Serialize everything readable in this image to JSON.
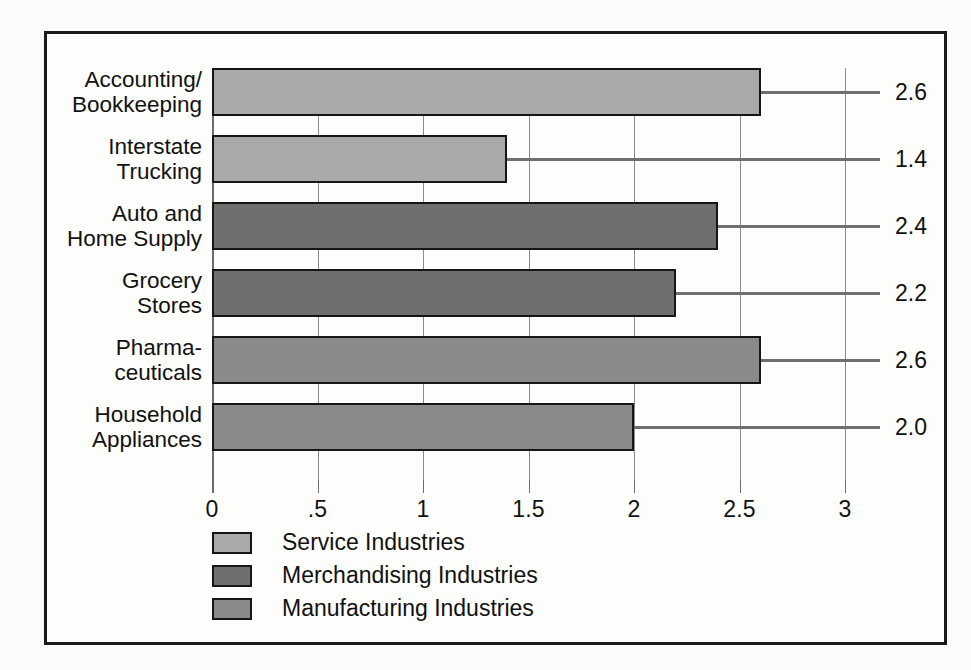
{
  "chart_data": {
    "type": "bar",
    "orientation": "horizontal",
    "title": "",
    "xlabel": "",
    "ylabel": "",
    "xlim": [
      0,
      3
    ],
    "grid": true,
    "legend_position": "bottom-left",
    "tick_labels": [
      "0",
      ".5",
      "1",
      "1.5",
      "2",
      "2.5",
      "3"
    ],
    "tick_values": [
      0,
      0.5,
      1,
      1.5,
      2,
      2.5,
      3
    ],
    "categories": [
      "Accounting/\nBookkeeping",
      "Interstate\nTrucking",
      "Auto and\nHome Supply",
      "Grocery\nStores",
      "Pharma-\nceuticals",
      "Household\nAppliances"
    ],
    "values": [
      2.6,
      1.4,
      2.4,
      2.2,
      2.6,
      2.0
    ],
    "value_labels": [
      "2.6",
      "1.4",
      "2.4",
      "2.2",
      "2.6",
      "2.0"
    ],
    "groups": [
      "Service Industries",
      "Service Industries",
      "Merchandising Industries",
      "Merchandising Industries",
      "Manufacturing Industries",
      "Manufacturing Industries"
    ],
    "bar_colors": [
      "#a9a9a9",
      "#a9a9a9",
      "#6f6f6f",
      "#6f6f6f",
      "#8a8a8a",
      "#8a8a8a"
    ],
    "legend": [
      {
        "label": "Service Industries",
        "color": "#a9a9a9"
      },
      {
        "label": "Merchandising Industries",
        "color": "#6f6f6f"
      },
      {
        "label": "Manufacturing Industries",
        "color": "#8a8a8a"
      }
    ]
  },
  "colors": {
    "background": "#fbfbf9",
    "panel": "#fdfdfb",
    "border": "#1a1a1a",
    "gridline": "#8b8b8b",
    "text": "#111111",
    "service": "#a9a9a9",
    "merchandising": "#6f6f6f",
    "manufacturing": "#8a8a8a"
  }
}
